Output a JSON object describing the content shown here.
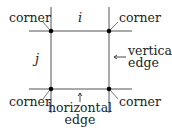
{
  "diagram": {
    "colors": {
      "line": "#555555",
      "dot": "#000000",
      "text": "#222222",
      "background": "#ffffff"
    },
    "labels": {
      "corner_top_left": "corner",
      "corner_top_right": "corner",
      "corner_bottom_left": "corner",
      "corner_bottom_right": "corner",
      "index_i": "i",
      "index_j": "j",
      "vertical_edge_line1": "vertical",
      "vertical_edge_line2": "edge",
      "horizontal_edge_line1": "horizontal",
      "horizontal_edge_line2": "edge"
    },
    "nodes": [
      {
        "name": "top-left",
        "x": 51,
        "y": 31
      },
      {
        "name": "top-right",
        "x": 109,
        "y": 31
      },
      {
        "name": "bottom-left",
        "x": 51,
        "y": 89
      },
      {
        "name": "bottom-right",
        "x": 109,
        "y": 89
      }
    ]
  }
}
